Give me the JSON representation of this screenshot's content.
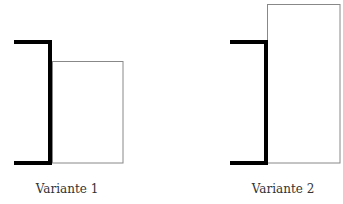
{
  "figure": {
    "variants": [
      {
        "label": "Variante 1",
        "bracket": {
          "x_left": 14,
          "x_right": 51,
          "y_top": 42,
          "y_bottom": 163
        },
        "rect": {
          "x": 52,
          "y": 61,
          "width": 71,
          "height": 102
        },
        "label_x": 67
      },
      {
        "label": "Variante 2",
        "bracket": {
          "x_left": 230,
          "x_right": 267,
          "y_top": 42,
          "y_bottom": 163
        },
        "rect": {
          "x": 267,
          "y": 4,
          "width": 73,
          "height": 159
        },
        "label_x": 283
      }
    ],
    "colors": {
      "bracket": "#000000",
      "rect_stroke": "#888888",
      "background": "#ffffff"
    }
  }
}
